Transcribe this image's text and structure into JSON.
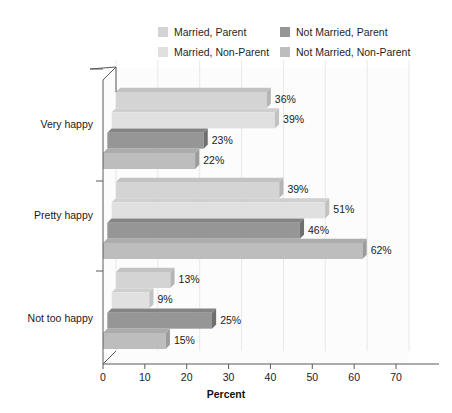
{
  "chart_data": {
    "type": "bar",
    "orientation": "horizontal",
    "style": "3d",
    "title": "",
    "subtitle": "",
    "xlabel": "Percent",
    "ylabel": "",
    "xlim": [
      0,
      70
    ],
    "xticks": [
      0,
      10,
      20,
      30,
      40,
      50,
      60,
      70
    ],
    "xtick_labels": [
      "0",
      "10",
      "20",
      "30",
      "40",
      "50",
      "60",
      "70"
    ],
    "grid": true,
    "grid_axis": "x",
    "legend_position": "top",
    "categories": [
      "Very happy",
      "Pretty happy",
      "Not too happy"
    ],
    "series": [
      {
        "name": "Married, Parent",
        "color": "#d4d4d4",
        "side_color": "#b5b5b5",
        "top_color": "#c2c2c2",
        "values": [
          36,
          39,
          13
        ],
        "labels": [
          "36%",
          "39%",
          "13%"
        ]
      },
      {
        "name": "Married, Non-Parent",
        "color": "#e0e0e0",
        "side_color": "#c2c2c2",
        "top_color": "#cfcfcf",
        "values": [
          39,
          51,
          9
        ],
        "labels": [
          "39%",
          "51%",
          "9%"
        ]
      },
      {
        "name": "Not Married, Parent",
        "color": "#969696",
        "side_color": "#6f6f6f",
        "top_color": "#848484",
        "values": [
          23,
          46,
          25
        ],
        "labels": [
          "23%",
          "46%",
          "25%"
        ]
      },
      {
        "name": "Not Married, Non-Parent",
        "color": "#bdbdbd",
        "side_color": "#9c9c9c",
        "top_color": "#acacac",
        "values": [
          22,
          62,
          15
        ],
        "labels": [
          "22%",
          "62%",
          "15%"
        ]
      }
    ]
  },
  "legend": {
    "items": [
      {
        "label": "Married, Parent",
        "color": "#d4d4d4"
      },
      {
        "label": "Not Married, Parent",
        "color": "#969696"
      },
      {
        "label": "Married, Non-Parent",
        "color": "#e0e0e0"
      },
      {
        "label": "Not Married, Non-Parent",
        "color": "#bdbdbd"
      }
    ]
  },
  "axis": {
    "x_title": "Percent",
    "x_tick_labels": [
      "0",
      "10",
      "20",
      "30",
      "40",
      "50",
      "60",
      "70"
    ],
    "y_category_labels": [
      "Very happy",
      "Pretty happy",
      "Not too happy"
    ]
  },
  "colors": {
    "plot_background": "#fcfcfc",
    "grid": "#e8e8e8",
    "axis": "#5a5a5a",
    "text": "#1a1a1a"
  }
}
